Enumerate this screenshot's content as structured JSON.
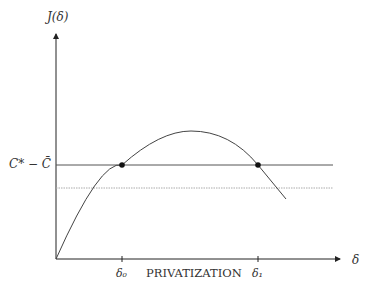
{
  "diagram": {
    "y_axis_label": "J(δ)",
    "x_axis_label": "δ",
    "threshold_label": "C* − C̄",
    "tick_labels": [
      "δ₀",
      "δ₁"
    ],
    "region_label": "PRIVATIZATION",
    "colors": {
      "axis": "#222222",
      "curve": "#444444",
      "threshold": "#555555",
      "dotted": "#aaaaaa",
      "point": "#111111"
    }
  }
}
